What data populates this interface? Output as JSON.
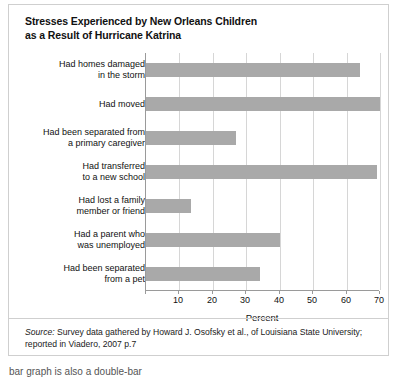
{
  "figure": {
    "title_lines": [
      "Stresses Experienced by New Orleans Children",
      "as a Result of Hurricane Katrina"
    ],
    "source_label": "Source:",
    "source_text_line1": " Survey data gathered by Howard J. Osofsky et al., of Louisiana State University;",
    "source_text_line2": "reported in Viadero, 2007 p.7",
    "bar_color": "#a9a9a9",
    "grid_color": "#d6d6d6",
    "axis_color": "#9a9a9a",
    "border_color": "#cfcfcf",
    "page_fragment": "bar graph is also a double-bar"
  },
  "chart_data": {
    "type": "bar",
    "orientation": "horizontal",
    "title": "Stresses Experienced by New Orleans Children as a Result of Hurricane Katrina",
    "xlabel": "Percent",
    "ylabel": "",
    "xlim": [
      0,
      70
    ],
    "xticks": [
      0,
      10,
      20,
      30,
      40,
      50,
      60,
      70
    ],
    "xticklabels": [
      "",
      "10",
      "20",
      "30",
      "40",
      "50",
      "60",
      "70"
    ],
    "grid": true,
    "legend": false,
    "categories": [
      [
        "Had homes damaged",
        "in the storm"
      ],
      [
        "Had moved"
      ],
      [
        "Had been separated from",
        "a primary caregiver"
      ],
      [
        "Had transferred",
        "to a new school"
      ],
      [
        "Had lost a family",
        "member or friend"
      ],
      [
        "Had a parent who",
        "was unemployed"
      ],
      [
        "Had been separated",
        "from a pet"
      ]
    ],
    "category_labels": [
      "Had homes damaged in the storm",
      "Had moved",
      "Had been separated from a primary caregiver",
      "Had transferred to a new school",
      "Had lost a family member or friend",
      "Had a parent who was unemployed",
      "Had been separated from a pet"
    ],
    "values": [
      64,
      70,
      27,
      69,
      13.5,
      40,
      34
    ]
  }
}
